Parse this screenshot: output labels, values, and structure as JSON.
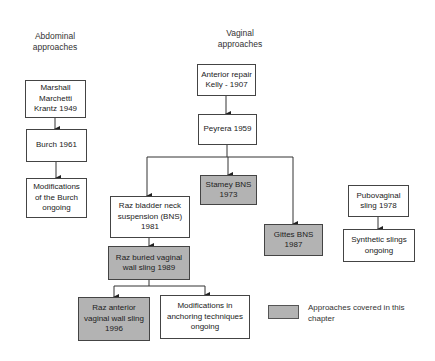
{
  "diagram": {
    "columns": {
      "abdominal": {
        "title_line1": "Abdominal",
        "title_line2": "approaches"
      },
      "vaginal": {
        "title_line1": "Vaginal",
        "title_line2": "approaches"
      }
    },
    "nodes": {
      "mmk": {
        "line1": "Marshall",
        "line2": "Marchetti",
        "line3": "Krantz  1949",
        "highlighted": false
      },
      "burch": {
        "line1": "Burch 1961",
        "highlighted": false
      },
      "burch_mods": {
        "line1": "Modifications",
        "line2": "of the Burch",
        "line3": "ongoing",
        "highlighted": false
      },
      "anterior_repair": {
        "line1": "Anterior repair",
        "line2": "Kelly - 1907",
        "highlighted": false
      },
      "peyrera": {
        "line1": "Peyrera 1959",
        "highlighted": false
      },
      "stamey": {
        "line1": "Stamey BNS",
        "line2": "1973",
        "highlighted": true
      },
      "raz_bns": {
        "line1": "Raz bladder neck",
        "line2": "suspension (BNS)",
        "line3": "1981",
        "highlighted": false
      },
      "gittes": {
        "line1": "Gittes BNS",
        "line2": "1987",
        "highlighted": true
      },
      "raz_buried": {
        "line1": "Raz buried vaginal",
        "line2": "wall sling 1989",
        "highlighted": true
      },
      "raz_anterior": {
        "line1": "Raz anterior",
        "line2": "vaginal wall sling",
        "line3": "1996",
        "highlighted": true
      },
      "anchoring_mods": {
        "line1": "Modifications in",
        "line2": "anchoring techniques",
        "line3": "ongoing",
        "highlighted": false
      },
      "pubovaginal": {
        "line1": "Pubovaginal",
        "line2": "sling 1978",
        "highlighted": false
      },
      "synthetic": {
        "line1": "Synthetic slings",
        "line2": "ongoing",
        "highlighted": false
      }
    },
    "edges": [
      [
        "mmk",
        "burch"
      ],
      [
        "burch",
        "burch_mods"
      ],
      [
        "anterior_repair",
        "peyrera"
      ],
      [
        "peyrera",
        "raz_bns"
      ],
      [
        "peyrera",
        "stamey"
      ],
      [
        "peyrera",
        "gittes"
      ],
      [
        "raz_bns",
        "raz_buried"
      ],
      [
        "raz_buried",
        "raz_anterior"
      ],
      [
        "raz_buried",
        "anchoring_mods"
      ],
      [
        "pubovaginal",
        "synthetic"
      ]
    ],
    "legend": {
      "line1": "Approaches covered in this",
      "line2": "chapter"
    },
    "colors": {
      "highlight_fill": "#b3b3b3",
      "border": "#444444",
      "background": "#ffffff"
    }
  }
}
